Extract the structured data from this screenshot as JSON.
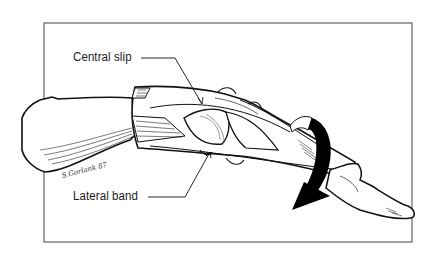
{
  "figure": {
    "type": "anatomical-illustration",
    "frame_color": "#444444",
    "ink_color": "#111111",
    "background_color": "#ffffff"
  },
  "labels": [
    {
      "id": "central-slip",
      "text": "Central slip"
    },
    {
      "id": "lateral-band",
      "text": "Lateral band"
    }
  ],
  "signature": {
    "text": "S.Gorlank 87"
  },
  "arrow": {
    "direction": "clockwise-rotation",
    "color": "#000000"
  }
}
